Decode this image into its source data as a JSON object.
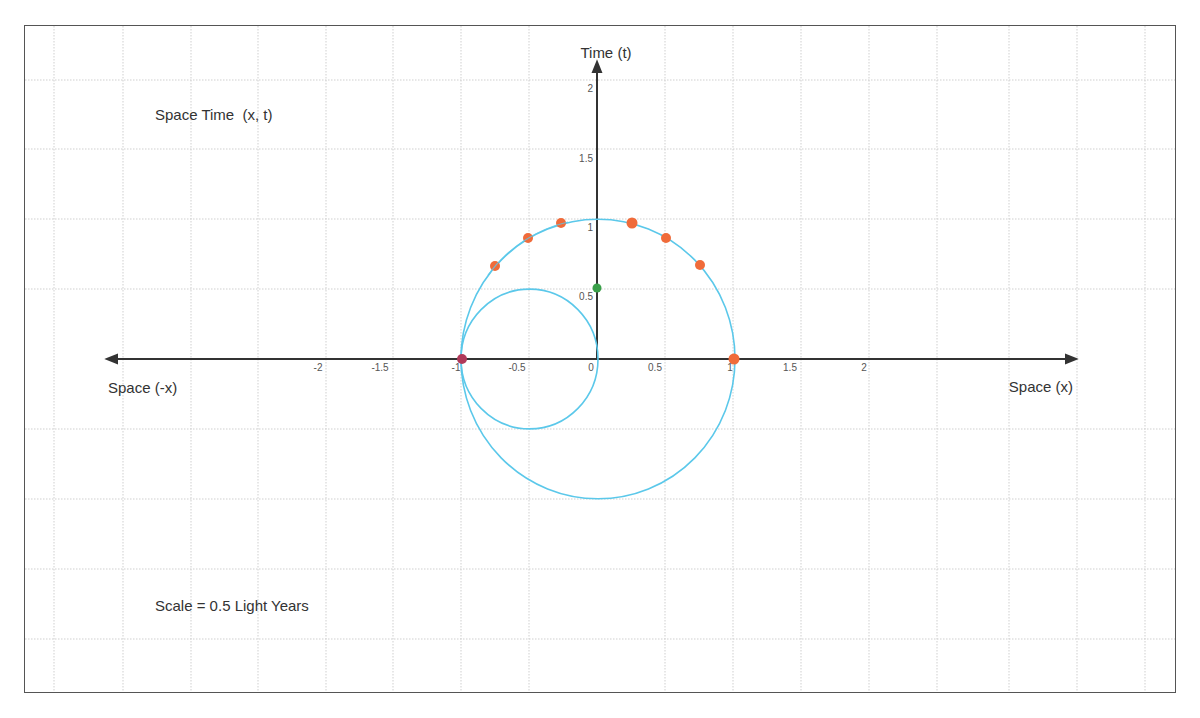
{
  "diagram": {
    "title": "Space Time  (x, t)",
    "scale_note": "Scale = 0.5 Light Years",
    "axes": {
      "x_negative_label": "Space (-x)",
      "x_positive_label": "Space (x)",
      "y_label": "Time (t)",
      "x_ticks": [
        "-2",
        "-1.5",
        "-1",
        "-0.5",
        "0",
        "0.5",
        "1",
        "1.5",
        "2"
      ],
      "y_ticks": [
        "0.5",
        "1",
        "1.5",
        "2"
      ]
    },
    "colors": {
      "curve": "#5bc8ea",
      "point_orange": "#f06b3a",
      "point_start": "#b03a5a",
      "point_green": "#3aa04a",
      "axis": "#333333",
      "grid": "#c8c8c8"
    },
    "curves": [
      {
        "name": "large circle",
        "center": [
          0,
          0
        ],
        "radius": 1
      },
      {
        "name": "small circle",
        "center": [
          -0.5,
          0
        ],
        "radius": 0.5
      }
    ],
    "points": [
      {
        "x": -1,
        "t": 0,
        "color": "start"
      },
      {
        "x": -0.75,
        "t": 0.66,
        "color": "orange"
      },
      {
        "x": -0.5,
        "t": 0.87,
        "color": "orange"
      },
      {
        "x": -0.26,
        "t": 0.97,
        "color": "orange"
      },
      {
        "x": 0.26,
        "t": 0.97,
        "color": "orange"
      },
      {
        "x": 0.5,
        "t": 0.87,
        "color": "orange"
      },
      {
        "x": 0.75,
        "t": 0.67,
        "color": "orange"
      },
      {
        "x": 1,
        "t": 0,
        "color": "orange"
      },
      {
        "x": 0,
        "t": 0.5,
        "color": "green"
      }
    ]
  }
}
